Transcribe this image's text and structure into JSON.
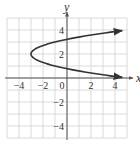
{
  "chart_data": {
    "type": "line",
    "title": "",
    "xlabel": "x",
    "ylabel": "y",
    "xlim": [
      -5,
      5
    ],
    "ylim": [
      -5,
      5
    ],
    "grid": true,
    "grid_step": 1,
    "x_ticks": [
      -4,
      -2,
      0,
      2,
      4
    ],
    "x_tick_labels": [
      "−4",
      "−2",
      "0",
      "2",
      "4"
    ],
    "y_ticks": [
      4,
      2,
      -2,
      -4
    ],
    "y_tick_labels": [
      "4",
      "2",
      "−2",
      "−4"
    ],
    "series": [
      {
        "name": "x = 2(y − 2)² − 3",
        "relation": "x = 2(y-2)^2 - 3",
        "vertex": [
          -3,
          2
        ],
        "y_range": [
          0.05,
          3.95
        ],
        "points": [
          [
            4.6,
            0.05
          ],
          [
            2.12,
            0.5
          ],
          [
            0,
            0.78
          ],
          [
            -1,
            1
          ],
          [
            -2.5,
            1.5
          ],
          [
            -3,
            2
          ],
          [
            -2.5,
            2.5
          ],
          [
            -1,
            3
          ],
          [
            0,
            3.22
          ],
          [
            2.12,
            3.5
          ],
          [
            4.6,
            3.95
          ]
        ],
        "arrows_at_ends": true,
        "color": "#333333"
      }
    ],
    "legend": null
  },
  "colors": {
    "grid": "#d9d9d9",
    "axis": "#555555",
    "curve": "#333333",
    "text": "#333333"
  }
}
